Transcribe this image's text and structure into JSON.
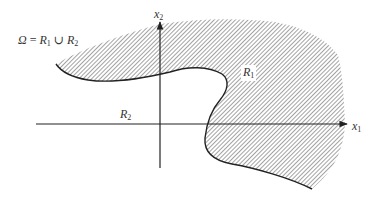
{
  "figure": {
    "type": "domain-diagram",
    "axes": {
      "horizontal": {
        "name": "x",
        "subscript": "1"
      },
      "vertical": {
        "name": "x",
        "subscript": "2"
      }
    },
    "equation": {
      "omega": "Ω",
      "equals": " = ",
      "r1_name": "R",
      "r1_sub": "1",
      "union": " ∪ ",
      "r2_name": "R",
      "r2_sub": "2"
    },
    "regions": [
      {
        "name": "R",
        "subscript": "1",
        "fill": "hatched"
      },
      {
        "name": "R",
        "subscript": "2",
        "fill": "none"
      }
    ],
    "colors": {
      "line": "#222222",
      "hatch": "#555555",
      "background": "#ffffff"
    }
  }
}
